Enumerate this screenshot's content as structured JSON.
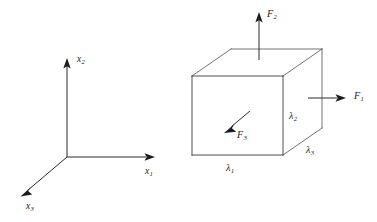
{
  "figure": {
    "background_color": "#ffffff",
    "line_color": "#3c3c3c",
    "text_color": "#1a1a1a"
  },
  "axes": {
    "name": "cartesian-axis-triad",
    "origin": {
      "x": 67,
      "y": 157
    },
    "labels": {
      "x1": {
        "base": "x",
        "sub": "1"
      },
      "x2": {
        "base": "x",
        "sub": "2"
      },
      "x3": {
        "base": "x",
        "sub": "3"
      }
    }
  },
  "cube": {
    "name": "cube-element",
    "front_face": {
      "left": 192,
      "top": 76,
      "right": 283,
      "bottom": 155
    },
    "depth_offset": {
      "dx": 39,
      "dy": -27
    }
  },
  "forces": {
    "f1": {
      "label_base": "F",
      "label_sub": "1",
      "direction": "right",
      "applied_face": "right-face"
    },
    "f2": {
      "label_base": "F",
      "label_sub": "2",
      "direction": "up",
      "applied_face": "top-face"
    },
    "f3": {
      "label_base": "F",
      "label_sub": "3",
      "direction": "down-left",
      "applied_face": "front-face"
    }
  },
  "dimensions": {
    "lambda1": {
      "label_base": "λ",
      "label_sub": "1",
      "edge": "front-bottom"
    },
    "lambda2": {
      "label_base": "λ",
      "label_sub": "2",
      "edge": "right-vertical"
    },
    "lambda3": {
      "label_base": "λ",
      "label_sub": "3",
      "edge": "bottom-depth"
    }
  }
}
